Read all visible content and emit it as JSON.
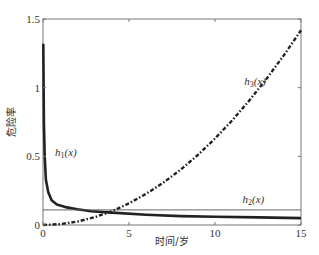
{
  "chart_data": {
    "type": "line",
    "title": "",
    "xlabel": "时间/岁",
    "ylabel": "危险率",
    "xlim": [
      0,
      15
    ],
    "ylim": [
      0,
      1.5
    ],
    "xticks": [
      0,
      5,
      10,
      15
    ],
    "xtick_labels": [
      "0",
      "5",
      "10",
      "15"
    ],
    "yticks": [
      0,
      0.5,
      1,
      1.5
    ],
    "ytick_labels": [
      "0",
      "0.5",
      "1",
      "1.5"
    ],
    "grid": false,
    "legend": "none",
    "series": [
      {
        "name": "h1(x)",
        "label_text": "h",
        "label_sub": "1",
        "label_suffix": "(x)",
        "style": "solid-thick",
        "x": [
          0.02,
          0.05,
          0.1,
          0.17,
          0.3,
          0.5,
          0.8,
          1.3,
          2,
          2.8,
          4,
          6,
          8,
          10,
          12.5,
          15
        ],
        "y": [
          1.32,
          0.75,
          0.5,
          0.33,
          0.24,
          0.18,
          0.15,
          0.13,
          0.115,
          0.1,
          0.09,
          0.075,
          0.065,
          0.06,
          0.055,
          0.05
        ]
      },
      {
        "name": "h2(x)",
        "label_text": "h",
        "label_sub": "2",
        "label_suffix": "(x)",
        "style": "solid-thin",
        "x": [
          0,
          15
        ],
        "y": [
          0.11,
          0.11
        ]
      },
      {
        "name": "h3(x)",
        "label_text": "h",
        "label_sub": "3",
        "label_suffix": "(x)",
        "style": "dash-dot",
        "x": [
          0,
          1,
          2,
          3,
          4,
          5,
          6,
          7,
          8,
          9,
          10,
          11,
          12,
          13,
          14,
          15
        ],
        "y": [
          0,
          0.0063,
          0.025,
          0.057,
          0.1,
          0.158,
          0.227,
          0.309,
          0.403,
          0.51,
          0.63,
          0.762,
          0.907,
          1.065,
          1.235,
          1.418
        ]
      }
    ],
    "annotations": [
      {
        "series": "h1(x)",
        "x": 0.7,
        "y": 0.5
      },
      {
        "series": "h2(x)",
        "x": 11.6,
        "y": 0.16
      },
      {
        "series": "h3(x)",
        "x": 11.7,
        "y": 1.02
      }
    ]
  }
}
